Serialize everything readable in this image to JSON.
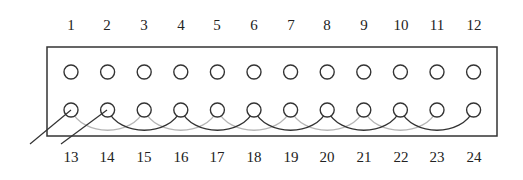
{
  "diagram": {
    "type": "pin-connector",
    "top_labels": [
      "1",
      "2",
      "3",
      "4",
      "5",
      "6",
      "7",
      "8",
      "9",
      "10",
      "11",
      "12"
    ],
    "bottom_labels": [
      "13",
      "14",
      "15",
      "16",
      "17",
      "18",
      "19",
      "20",
      "21",
      "22",
      "23",
      "24"
    ],
    "dark_arcs": [
      [
        14,
        16
      ],
      [
        16,
        18
      ],
      [
        18,
        20
      ],
      [
        20,
        22
      ],
      [
        22,
        24
      ]
    ],
    "light_arcs": [
      [
        13,
        15
      ],
      [
        15,
        17
      ],
      [
        17,
        19
      ],
      [
        19,
        21
      ],
      [
        21,
        23
      ]
    ],
    "lead_wires": [
      13,
      14
    ],
    "colors": {
      "outline": "#333333",
      "dark_arc": "#333333",
      "light_arc": "#b5b5b5",
      "text": "#222222"
    }
  }
}
